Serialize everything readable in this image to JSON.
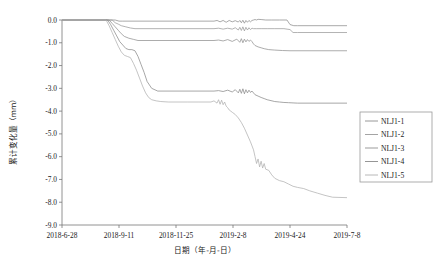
{
  "chart_data": {
    "type": "line",
    "title": "",
    "xlabel": "日期（年-月-日）",
    "ylabel": "累计变化量（mm）",
    "xtick_labels": [
      "2018-6-28",
      "2018-9-11",
      "2018-11-25",
      "2019-2-8",
      "2019-4-24",
      "2019-7-8"
    ],
    "ytick_labels": [
      "0.0",
      "-1.0",
      "-2.0",
      "-3.0",
      "-4.0",
      "-5.0",
      "-6.0",
      "-7.0",
      "-8.0",
      "-9.0"
    ],
    "ytick_values": [
      0.0,
      -1.0,
      -2.0,
      -3.0,
      -4.0,
      -5.0,
      -6.0,
      -7.0,
      -8.0,
      -9.0
    ],
    "ylim": [
      -9.0,
      0.0
    ],
    "xlim": [
      0,
      375
    ],
    "grid": false,
    "legend_position": "right-outside",
    "legend_entries": [
      "NLJ1-1",
      "NLJ1-2",
      "NLJ1-3",
      "NLJ1-4",
      "NLJ1-5"
    ],
    "colors": {
      "NLJ1-1": "#8c8c8c",
      "NLJ1-2": "#9a9a9a",
      "NLJ1-3": "#909090",
      "NLJ1-4": "#8a8a8a",
      "NLJ1-5": "#b0b0b0",
      "axis": "#777777",
      "text": "#1a1a1a"
    },
    "series": [
      {
        "name": "NLJ1-1",
        "x": [
          0,
          70,
          75,
          80,
          200,
          204,
          208,
          212,
          216,
          220,
          224,
          228,
          232,
          234,
          236,
          238,
          240,
          242,
          244,
          246,
          248,
          250,
          252,
          254,
          256,
          258,
          262,
          268,
          276,
          286,
          296,
          300,
          305,
          310,
          375
        ],
        "values": [
          0.0,
          0.0,
          -0.05,
          -0.05,
          -0.05,
          -0.02,
          -0.08,
          -0.02,
          -0.1,
          -0.02,
          -0.08,
          -0.03,
          -0.09,
          -0.02,
          -0.12,
          -0.01,
          -0.14,
          -0.02,
          -0.1,
          -0.02,
          -0.08,
          -0.02,
          0.0,
          0.02,
          0.0,
          0.03,
          0.02,
          0.0,
          0.0,
          0.0,
          0.0,
          -0.2,
          -0.25,
          -0.25,
          -0.25
        ]
      },
      {
        "name": "NLJ1-2",
        "x": [
          0,
          66,
          70,
          74,
          78,
          84,
          90,
          96,
          200,
          206,
          212,
          218,
          224,
          228,
          232,
          234,
          236,
          238,
          240,
          242,
          244,
          246,
          248,
          250,
          252,
          256,
          262,
          270,
          280,
          292,
          300,
          304,
          310,
          375
        ],
        "values": [
          0.0,
          0.0,
          -0.12,
          -0.18,
          -0.25,
          -0.3,
          -0.35,
          -0.38,
          -0.38,
          -0.36,
          -0.4,
          -0.36,
          -0.4,
          -0.34,
          -0.44,
          -0.32,
          -0.46,
          -0.3,
          -0.48,
          -0.32,
          -0.44,
          -0.34,
          -0.42,
          -0.36,
          -0.38,
          -0.38,
          -0.38,
          -0.38,
          -0.38,
          -0.38,
          -0.42,
          -0.55,
          -0.55,
          -0.55
        ]
      },
      {
        "name": "NLJ1-3",
        "x": [
          0,
          62,
          66,
          70,
          74,
          78,
          82,
          88,
          94,
          100,
          200,
          206,
          212,
          218,
          224,
          230,
          234,
          236,
          238,
          240,
          242,
          244,
          246,
          248,
          250,
          252,
          254,
          258,
          262,
          266,
          272,
          280,
          290,
          300,
          375
        ],
        "values": [
          0.0,
          0.0,
          -0.15,
          -0.3,
          -0.45,
          -0.6,
          -0.72,
          -0.8,
          -0.85,
          -0.9,
          -0.9,
          -0.88,
          -0.92,
          -0.86,
          -0.94,
          -0.84,
          -0.98,
          -0.82,
          -1.0,
          -0.84,
          -0.96,
          -0.86,
          -0.94,
          -0.88,
          -0.95,
          -1.05,
          -1.12,
          -1.18,
          -1.22,
          -1.26,
          -1.3,
          -1.32,
          -1.34,
          -1.35,
          -1.35
        ]
      },
      {
        "name": "NLJ1-4",
        "x": [
          0,
          60,
          64,
          68,
          72,
          76,
          80,
          84,
          88,
          92,
          96,
          100,
          104,
          108,
          112,
          118,
          126,
          200,
          206,
          212,
          218,
          224,
          228,
          232,
          234,
          236,
          238,
          240,
          242,
          244,
          246,
          248,
          250,
          252,
          254,
          258,
          262,
          266,
          270,
          275,
          280,
          286,
          292,
          298,
          304,
          310,
          375
        ],
        "values": [
          0.0,
          0.0,
          -0.2,
          -0.45,
          -0.7,
          -0.95,
          -1.1,
          -1.25,
          -1.3,
          -1.3,
          -1.35,
          -1.6,
          -1.95,
          -2.3,
          -2.7,
          -3.0,
          -3.12,
          -3.12,
          -3.1,
          -3.14,
          -3.08,
          -3.16,
          -3.06,
          -3.2,
          -3.04,
          -3.22,
          -3.02,
          -3.24,
          -3.06,
          -3.2,
          -3.08,
          -3.18,
          -3.12,
          -3.2,
          -3.28,
          -3.34,
          -3.4,
          -3.45,
          -3.5,
          -3.54,
          -3.58,
          -3.6,
          -3.62,
          -3.63,
          -3.64,
          -3.65,
          -3.65
        ]
      },
      {
        "name": "NLJ1-5",
        "x": [
          0,
          58,
          62,
          66,
          70,
          74,
          78,
          82,
          86,
          90,
          94,
          98,
          102,
          106,
          110,
          114,
          118,
          124,
          130,
          140,
          150,
          165,
          180,
          196,
          200,
          204,
          206,
          208,
          210,
          212,
          214,
          216,
          218,
          220,
          224,
          228,
          232,
          236,
          240,
          244,
          248,
          252,
          254,
          256,
          258,
          260,
          262,
          264,
          266,
          268,
          272,
          276,
          280,
          286,
          292,
          298,
          304,
          310,
          318,
          326,
          336,
          346,
          356,
          375
        ],
        "values": [
          0.0,
          0.0,
          -0.25,
          -0.55,
          -0.85,
          -1.15,
          -1.4,
          -1.55,
          -1.6,
          -1.65,
          -1.9,
          -2.2,
          -2.55,
          -2.9,
          -3.2,
          -3.4,
          -3.5,
          -3.55,
          -3.58,
          -3.6,
          -3.6,
          -3.6,
          -3.6,
          -3.6,
          -3.55,
          -3.65,
          -3.5,
          -3.7,
          -3.52,
          -3.72,
          -3.6,
          -3.78,
          -3.85,
          -3.95,
          -4.05,
          -4.15,
          -4.3,
          -4.5,
          -4.75,
          -5.05,
          -5.35,
          -5.7,
          -6.0,
          -6.3,
          -6.1,
          -6.45,
          -6.2,
          -6.5,
          -6.3,
          -6.55,
          -6.6,
          -6.8,
          -6.95,
          -7.05,
          -7.1,
          -7.2,
          -7.3,
          -7.35,
          -7.4,
          -7.5,
          -7.6,
          -7.7,
          -7.78,
          -7.8
        ]
      }
    ]
  }
}
